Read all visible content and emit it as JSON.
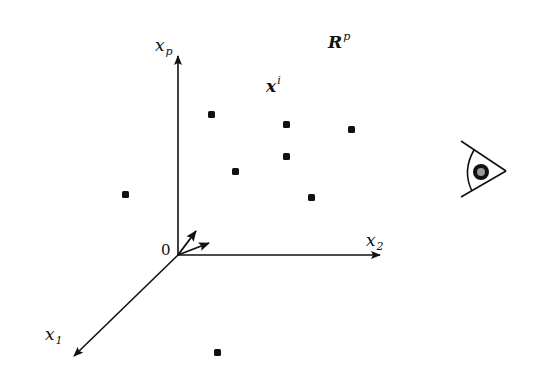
{
  "diagram": {
    "space_label": {
      "main": "R",
      "sup": "p"
    },
    "point_label": {
      "main": "x",
      "sup": "i"
    },
    "origin_label": "0",
    "axes": [
      {
        "name": "x_p",
        "main": "x",
        "sub": "p",
        "direction": "up"
      },
      {
        "name": "x_2",
        "main": "x",
        "sub": "2",
        "direction": "right"
      },
      {
        "name": "x_1",
        "main": "x",
        "sub": "1",
        "direction": "down-left"
      }
    ],
    "origin": [
      178,
      255
    ],
    "points": [
      [
        211,
        114
      ],
      [
        286,
        124
      ],
      [
        351,
        129
      ],
      [
        286,
        156
      ],
      [
        235,
        171
      ],
      [
        311,
        197
      ],
      [
        125,
        194
      ],
      [
        217,
        352
      ]
    ],
    "projection_vectors": 2,
    "observer_icon": "eye-icon",
    "colors": {
      "ink": "#111111",
      "pupil": "#999999",
      "background": "#ffffff"
    }
  }
}
